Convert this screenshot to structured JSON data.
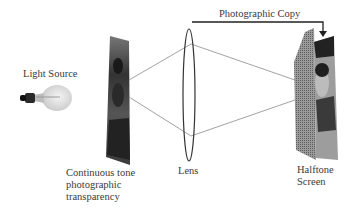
{
  "diagram": {
    "labels": {
      "light_source": "Light Source",
      "transparency_line1": "Continuous tone",
      "transparency_line2": "photographic",
      "transparency_line3": "transparency",
      "lens": "Lens",
      "halftone_line1": "Halftone",
      "halftone_line2": "Screen",
      "photographic_copy": "Photographic Copy"
    },
    "colors": {
      "ray": "#8a8a8a",
      "lens": "#333333",
      "arrow": "#222222",
      "halftone_screen": "#7d7d7d"
    }
  }
}
